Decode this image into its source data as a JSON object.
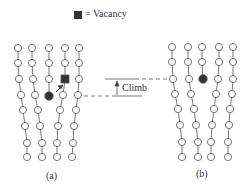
{
  "legend": {
    "symbol": "filled-square",
    "text": "= Vacancy"
  },
  "annotation": {
    "text": "Climb"
  },
  "panels": [
    {
      "label": "(a)"
    },
    {
      "label": "(b)"
    }
  ],
  "colors": {
    "atom_stroke": "#555555",
    "atom_fill": "#ffffff",
    "extra_atom": "#333333",
    "vacancy": "#333333",
    "line": "#555555"
  }
}
